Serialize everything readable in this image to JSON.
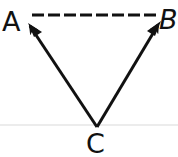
{
  "diagram": {
    "type": "vector-triangle",
    "colors": {
      "stroke": "#111111",
      "background": "#ffffff",
      "faint_rule": "#ececec"
    },
    "nodes": [
      {
        "id": "A",
        "label": "A",
        "x": 28,
        "y": 24
      },
      {
        "id": "B",
        "label": "B",
        "x": 160,
        "y": 22
      },
      {
        "id": "C",
        "label": "C",
        "x": 97,
        "y": 127
      }
    ],
    "edges": [
      {
        "from": "C",
        "to": "A",
        "style": "solid",
        "arrow": "end"
      },
      {
        "from": "C",
        "to": "B",
        "style": "solid",
        "arrow": "end"
      },
      {
        "from": "A",
        "to": "B",
        "style": "dashed",
        "arrow": "none"
      }
    ],
    "labels": {
      "a": "A",
      "b": "B",
      "c": "C"
    }
  }
}
